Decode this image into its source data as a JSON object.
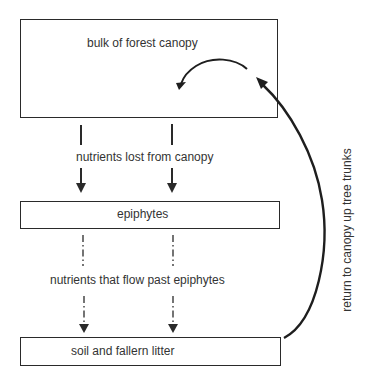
{
  "diagram": {
    "type": "nutrient-flow",
    "nodes": [
      {
        "id": "canopy",
        "label": "bulk of forest canopy"
      },
      {
        "id": "epiphytes",
        "label": "epiphytes"
      },
      {
        "id": "soil",
        "label": "soil and fallern litter"
      }
    ],
    "edges": [
      {
        "from": "canopy",
        "to": "epiphytes",
        "label": "nutrients lost from canopy",
        "style": "solid",
        "count": 2
      },
      {
        "from": "epiphytes",
        "to": "soil",
        "label": "nutrients that flow past epiphytes",
        "style": "dash-dot",
        "count": 2
      },
      {
        "from": "soil",
        "to": "canopy",
        "label": "return to canopy up tree trunks",
        "style": "solid-curved"
      },
      {
        "from": "canopy",
        "to": "canopy",
        "label": "",
        "style": "solid-curved-internal"
      }
    ]
  },
  "colors": {
    "line": "#2a2a2a",
    "text": "#333333",
    "background": "#ffffff"
  }
}
